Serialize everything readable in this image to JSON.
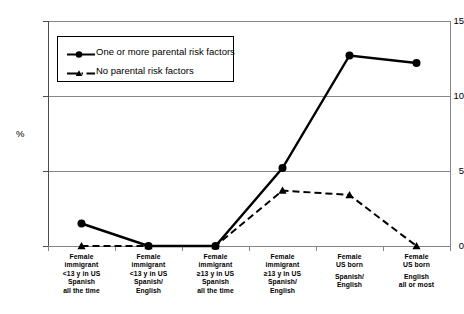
{
  "chart_data": {
    "type": "line",
    "title": "",
    "xlabel": "",
    "ylabel": "%",
    "ylim": [
      0,
      15
    ],
    "yticks": [
      0,
      5,
      10,
      15
    ],
    "grid": true,
    "legend_position": "upper-left-inside",
    "categories": [
      "Female immigrant <13 y in US Spanish all the time",
      "Female immigrant <13 y in US Spanish/ English",
      "Female immigrant ≥13 y in US Spanish all the time",
      "Female immigrant ≥13 y in US Spanish/ English",
      "Female US born Spanish/ English",
      "Female US born English all or most"
    ],
    "category_lines": [
      [
        "Female",
        "immigrant",
        "<13 y in US",
        "Spanish",
        "all the time"
      ],
      [
        "Female",
        "immigrant",
        "<13 y in US",
        "Spanish/",
        "English"
      ],
      [
        "Female",
        "immigrant",
        "≥13 y in US",
        "Spanish",
        "all the time"
      ],
      [
        "Female",
        "immigrant",
        "≥13 y in US",
        "Spanish/",
        "English"
      ],
      [
        "Female",
        "US born",
        "",
        "Spanish/",
        "English"
      ],
      [
        "Female",
        "US born",
        "",
        "English",
        "all or most"
      ]
    ],
    "series": [
      {
        "name": "One or more parental risk factors",
        "style": "solid",
        "marker": "circle",
        "color": "#000000",
        "values": [
          1.5,
          0.0,
          0.0,
          5.2,
          12.7,
          12.2
        ]
      },
      {
        "name": "No parental risk factors",
        "style": "dashed",
        "marker": "triangle",
        "color": "#000000",
        "values": [
          0.0,
          0.0,
          0.0,
          3.7,
          3.4,
          0.0
        ]
      }
    ]
  },
  "axis": {
    "y_title": "%",
    "y_tick_labels": [
      "15",
      "10",
      "5",
      "0"
    ]
  },
  "legend": {
    "items": [
      {
        "label": "One or more parental risk factors",
        "marker": "circle-solid-line"
      },
      {
        "label": "No parental risk factors",
        "marker": "triangle-dashed-line"
      }
    ]
  }
}
